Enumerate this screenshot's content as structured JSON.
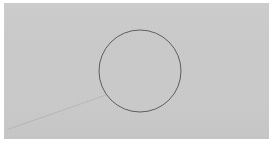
{
  "image": {
    "width": 273,
    "height": 143,
    "background_color": "#ffffff",
    "description": "Low-resolution grayscale raster of a simple line drawing: a thin circle outline on a flat light-gray field, with a faint straight line running from the lower-left corner area up to the lower-left side of the circle."
  },
  "panel": {
    "name": "drawing-panel",
    "fill_color": "#c9c9c9",
    "x": 4,
    "y": 3,
    "width": 265,
    "height": 136,
    "has_visible_border": false
  },
  "figure": {
    "title_visible": false,
    "labels": [],
    "shapes": [
      {
        "id": "circle-main",
        "type": "circle",
        "role": "primary-outline",
        "center_x": 140,
        "center_y": 71,
        "radius": 41,
        "stroke_color": "#5d5d5d",
        "stroke_width": 1,
        "fill": "none",
        "fill_note": "interior is the same flat light gray as the surrounding field"
      },
      {
        "id": "line-tangent-faint",
        "type": "line",
        "role": "faint-construction-line",
        "x1": 9,
        "y1": 129,
        "x2": 106,
        "y2": 95,
        "stroke_color": "#b4b4b4",
        "stroke_width": 1,
        "opacity": 0.85,
        "note": "very low contrast; approaches the circle near its lower-left arc"
      }
    ]
  },
  "palette": {
    "page_background": "#ffffff",
    "field_gray": "#c9c9c9",
    "circle_stroke": "#5d5d5d",
    "faint_line": "#b4b4b4",
    "interior_gray": "#cbcbcb"
  }
}
